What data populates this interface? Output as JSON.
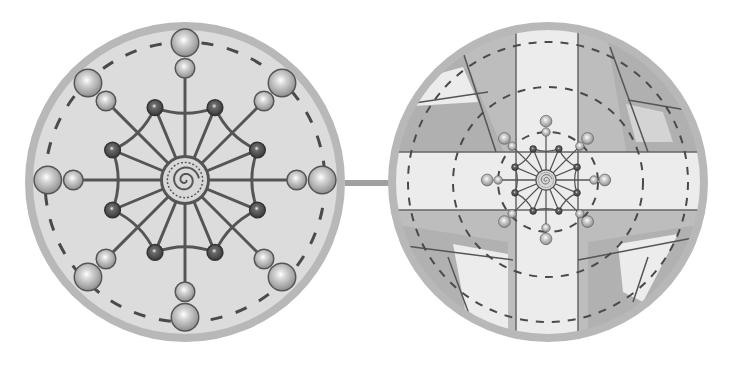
{
  "figure": {
    "colors": {
      "background": "#ffffff",
      "rim": "#b8b8b8",
      "disc_fill": "#dcdcdc",
      "line": "#555555",
      "dashed": "#4a4a4a",
      "bead_light": "#c8c8c8",
      "bead_dark": "#5a5a5a",
      "panel_light": "#ececec",
      "panel_mid": "#bdbdbd",
      "panel_dark": "#a6a6a6",
      "connector": "#a0a0a0"
    },
    "left_circle": {
      "label": "web-mandala",
      "center": [
        185,
        182
      ],
      "radius": 160,
      "spokes": 16,
      "dashed_ring_radius": 140,
      "spiral_center": true
    },
    "right_circle": {
      "label": "cross-grid-with-mandala",
      "center": [
        548,
        182
      ],
      "radius": 160,
      "dashed_rings": [
        50,
        95,
        140
      ],
      "cross_arms": [
        "horizontal",
        "vertical"
      ]
    },
    "connector": {
      "from_x": 345,
      "to_x": 390,
      "y": 183
    }
  }
}
